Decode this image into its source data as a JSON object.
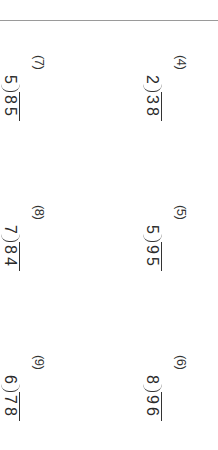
{
  "worksheet": {
    "orientation": "rotated 90 degrees clockwise",
    "problems": [
      {
        "label": "(4)",
        "divisor": "2",
        "dividend": "38"
      },
      {
        "label": "(5)",
        "divisor": "5",
        "dividend": "95"
      },
      {
        "label": "(6)",
        "divisor": "8",
        "dividend": "96"
      },
      {
        "label": "(7)",
        "divisor": "5",
        "dividend": "85"
      },
      {
        "label": "(8)",
        "divisor": "7",
        "dividend": "84"
      },
      {
        "label": "(9)",
        "divisor": "6",
        "dividend": "78"
      }
    ]
  }
}
